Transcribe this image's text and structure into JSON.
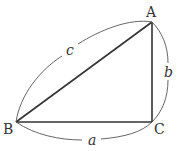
{
  "diagram": {
    "type": "right-triangle",
    "vertices": {
      "A": {
        "label": "A",
        "x": 152,
        "y": 22
      },
      "B": {
        "label": "B",
        "x": 16,
        "y": 122
      },
      "C": {
        "label": "C",
        "x": 152,
        "y": 122
      }
    },
    "sides": {
      "a": {
        "label": "a",
        "between": [
          "B",
          "C"
        ]
      },
      "b": {
        "label": "b",
        "between": [
          "C",
          "A"
        ]
      },
      "c": {
        "label": "c",
        "between": [
          "B",
          "A"
        ]
      }
    },
    "right_angle_at": "C",
    "colors": {
      "edge": "#333333",
      "arc": "#555555",
      "text": "#333333"
    }
  }
}
